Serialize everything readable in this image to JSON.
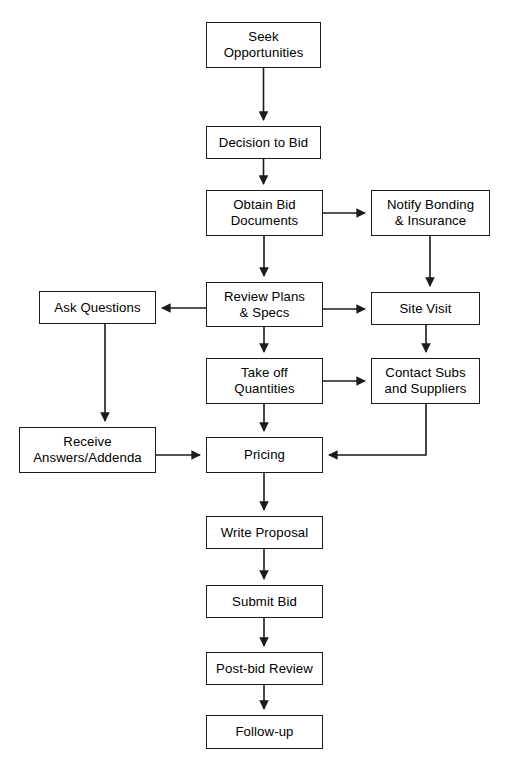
{
  "diagram": {
    "type": "flowchart",
    "background_color": "#ffffff",
    "line_color": "#1b1b1b",
    "text_color": "#000000",
    "nodes": [
      {
        "id": "seek",
        "label": "Seek\nOpportunities",
        "x": 206,
        "y": 22,
        "w": 115,
        "h": 46
      },
      {
        "id": "decision",
        "label": "Decision to Bid",
        "x": 206,
        "y": 126,
        "w": 115,
        "h": 33
      },
      {
        "id": "obtain",
        "label": "Obtain Bid\nDocuments",
        "x": 206,
        "y": 190,
        "w": 117,
        "h": 46
      },
      {
        "id": "notify",
        "label": "Notify Bonding\n& Insurance",
        "x": 371,
        "y": 190,
        "w": 119,
        "h": 46
      },
      {
        "id": "review",
        "label": "Review Plans\n& Specs",
        "x": 206,
        "y": 282,
        "w": 117,
        "h": 45
      },
      {
        "id": "ask",
        "label": "Ask Questions",
        "x": 39,
        "y": 291,
        "w": 117,
        "h": 33
      },
      {
        "id": "sitevisit",
        "label": "Site Visit",
        "x": 371,
        "y": 292,
        "w": 109,
        "h": 33
      },
      {
        "id": "takeoff",
        "label": "Take off\nQuantities",
        "x": 206,
        "y": 358,
        "w": 117,
        "h": 46
      },
      {
        "id": "contact",
        "label": "Contact Subs\nand Suppliers",
        "x": 371,
        "y": 358,
        "w": 109,
        "h": 46
      },
      {
        "id": "receive",
        "label": "Receive\nAnswers/Addenda",
        "x": 19,
        "y": 427,
        "w": 137,
        "h": 46
      },
      {
        "id": "pricing",
        "label": "Pricing",
        "x": 206,
        "y": 437,
        "w": 117,
        "h": 36
      },
      {
        "id": "write",
        "label": "Write Proposal",
        "x": 206,
        "y": 516,
        "w": 117,
        "h": 33
      },
      {
        "id": "submit",
        "label": "Submit Bid",
        "x": 206,
        "y": 585,
        "w": 117,
        "h": 33
      },
      {
        "id": "postbid",
        "label": "Post-bid Review",
        "x": 206,
        "y": 652,
        "w": 117,
        "h": 33
      },
      {
        "id": "followup",
        "label": "Follow-up",
        "x": 206,
        "y": 715,
        "w": 117,
        "h": 34
      }
    ],
    "edges": [
      {
        "from": "seek",
        "to": "decision",
        "path": "M 263.5 68 L 263.5 120",
        "arrow": "down"
      },
      {
        "from": "decision",
        "to": "obtain",
        "path": "M 263.5 159 L 263.5 184",
        "arrow": "down"
      },
      {
        "from": "obtain",
        "to": "notify",
        "path": "M 323 213 L 365 213",
        "arrow": "right"
      },
      {
        "from": "obtain",
        "to": "review",
        "path": "M 264 236 L 264 276",
        "arrow": "down"
      },
      {
        "from": "notify",
        "to": "sitevisit",
        "path": "M 430 236 L 430 286",
        "arrow": "down"
      },
      {
        "from": "review",
        "to": "ask",
        "path": "M 206 308 L 162 308",
        "arrow": "left"
      },
      {
        "from": "review",
        "to": "sitevisit",
        "path": "M 323 309 L 365 309",
        "arrow": "right"
      },
      {
        "from": "review",
        "to": "takeoff",
        "path": "M 264 327 L 264 352",
        "arrow": "down"
      },
      {
        "from": "sitevisit",
        "to": "contact",
        "path": "M 426 325 L 426 352",
        "arrow": "down"
      },
      {
        "from": "takeoff",
        "to": "contact",
        "path": "M 323 381 L 365 381",
        "arrow": "right"
      },
      {
        "from": "ask",
        "to": "receive",
        "path": "M 105 324 L 105 421",
        "arrow": "down"
      },
      {
        "from": "takeoff",
        "to": "pricing",
        "path": "M 264 404 L 264 431",
        "arrow": "down"
      },
      {
        "from": "receive",
        "to": "pricing",
        "path": "M 156 455 L 200 455",
        "arrow": "right"
      },
      {
        "from": "contact",
        "to": "pricing",
        "path": "M 426 404 L 426 455 L 329 455",
        "arrow": "left"
      },
      {
        "from": "pricing",
        "to": "write",
        "path": "M 264 473 L 264 510",
        "arrow": "down"
      },
      {
        "from": "write",
        "to": "submit",
        "path": "M 264 549 L 264 579",
        "arrow": "down"
      },
      {
        "from": "submit",
        "to": "postbid",
        "path": "M 264 618 L 264 646",
        "arrow": "down"
      },
      {
        "from": "postbid",
        "to": "followup",
        "path": "M 264 685 L 264 709",
        "arrow": "down"
      }
    ]
  }
}
